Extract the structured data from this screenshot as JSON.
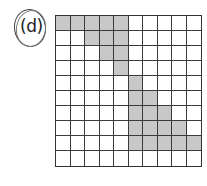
{
  "label": "(d)",
  "grid": {
    "rows": 10,
    "cols": 10,
    "shaded_color": "#c8c8c8",
    "shaded_cells": [
      [
        0,
        0
      ],
      [
        0,
        1
      ],
      [
        0,
        2
      ],
      [
        0,
        3
      ],
      [
        0,
        4
      ],
      [
        1,
        2
      ],
      [
        1,
        3
      ],
      [
        1,
        4
      ],
      [
        2,
        3
      ],
      [
        2,
        4
      ],
      [
        3,
        4
      ],
      [
        4,
        5
      ],
      [
        5,
        5
      ],
      [
        5,
        6
      ],
      [
        6,
        5
      ],
      [
        6,
        6
      ],
      [
        6,
        7
      ],
      [
        7,
        5
      ],
      [
        7,
        6
      ],
      [
        7,
        7
      ],
      [
        7,
        8
      ],
      [
        8,
        5
      ],
      [
        8,
        6
      ],
      [
        8,
        7
      ],
      [
        8,
        8
      ],
      [
        8,
        9
      ]
    ],
    "shaded_count": 26,
    "total_cells": 100
  }
}
